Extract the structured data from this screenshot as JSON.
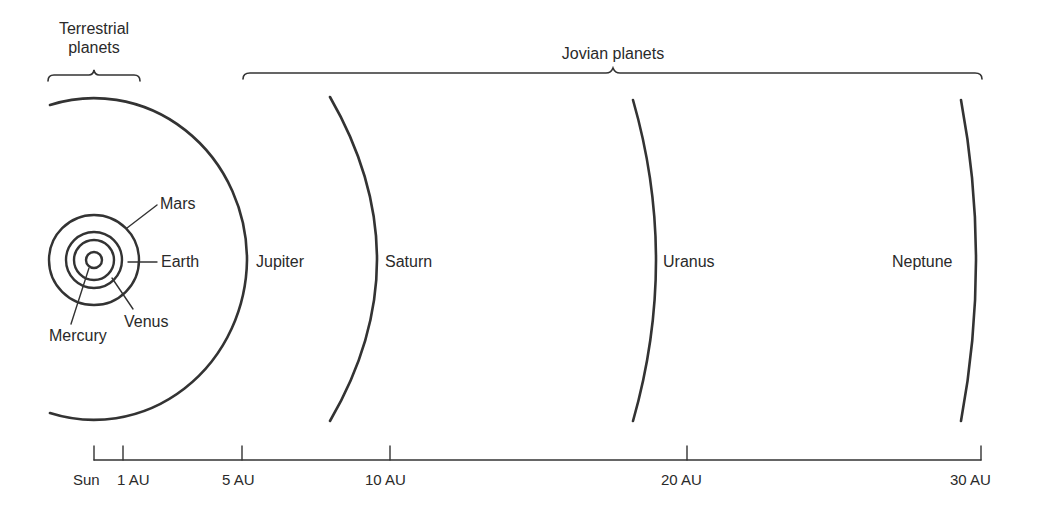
{
  "diagram": {
    "type": "solar-system-orbit-scale",
    "line_color": "#333333",
    "groups": {
      "terrestrial": {
        "title_line1": "Terrestrial",
        "title_line2": "planets"
      },
      "jovian": {
        "title": "Jovian planets"
      }
    },
    "planets": [
      {
        "name": "Mercury",
        "group": "terrestrial"
      },
      {
        "name": "Venus",
        "group": "terrestrial"
      },
      {
        "name": "Earth",
        "group": "terrestrial"
      },
      {
        "name": "Mars",
        "group": "terrestrial"
      },
      {
        "name": "Jupiter",
        "group": "jovian"
      },
      {
        "name": "Saturn",
        "group": "jovian"
      },
      {
        "name": "Uranus",
        "group": "jovian"
      },
      {
        "name": "Neptune",
        "group": "jovian"
      }
    ],
    "scale_axis": {
      "ticks": [
        {
          "label": "Sun",
          "au": 0
        },
        {
          "label": "1 AU",
          "au": 1
        },
        {
          "label": "5 AU",
          "au": 5
        },
        {
          "label": "10 AU",
          "au": 10
        },
        {
          "label": "20 AU",
          "au": 20
        },
        {
          "label": "30 AU",
          "au": 30
        }
      ]
    }
  }
}
